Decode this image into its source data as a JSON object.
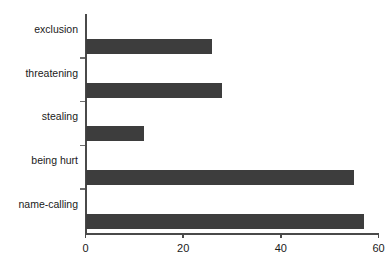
{
  "chart_data": {
    "type": "bar",
    "orientation": "horizontal",
    "title": "",
    "subtitle": "",
    "xlabel": "",
    "ylabel": "",
    "categories": [
      "name-calling",
      "being hurt",
      "stealing",
      "threatening",
      "exclusion"
    ],
    "values": [
      57,
      55,
      12,
      28,
      26
    ],
    "xlim": [
      0,
      60
    ],
    "xticks": [
      0,
      20,
      40,
      60
    ],
    "xtick_labels": [
      "0",
      "20",
      "40",
      "60"
    ],
    "grid": false,
    "legend": null,
    "bar_color": "#3d3d3d",
    "axis_color": "#4a4a4a",
    "background_color": "#ffffff"
  }
}
